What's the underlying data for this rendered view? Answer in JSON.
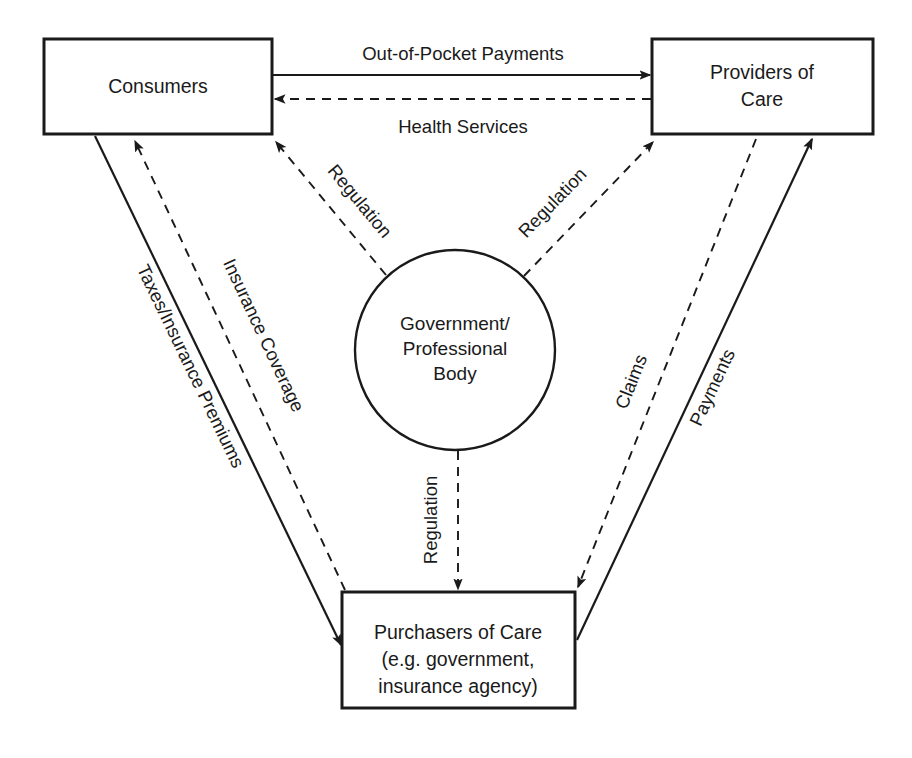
{
  "diagram": {
    "background_color": "#ffffff",
    "line_color": "#1a1a1a",
    "nodes": [
      {
        "id": "consumers",
        "shape": "rectangle",
        "label_line1": "Consumers",
        "label_line2": "",
        "label_line3": "",
        "x": 44,
        "y": 39,
        "width": 228,
        "height": 95
      },
      {
        "id": "providers",
        "shape": "rectangle",
        "label_line1": "Providers of",
        "label_line2": "Care",
        "label_line3": "",
        "x": 652,
        "y": 39,
        "width": 221,
        "height": 95
      },
      {
        "id": "purchasers",
        "shape": "rectangle",
        "label_line1": "Purchasers of Care",
        "label_line2": "(e.g. government,",
        "label_line3": "insurance agency)",
        "x": 342,
        "y": 592,
        "width": 233,
        "height": 116
      },
      {
        "id": "government",
        "shape": "circle",
        "label_line1": "Government/",
        "label_line2": "Professional",
        "label_line3": "Body",
        "cx": 455,
        "cy": 350,
        "r": 100
      }
    ],
    "edges": [
      {
        "id": "out-of-pocket-payments",
        "label": "Out-of-Pocket Payments",
        "style": "solid",
        "from": "consumers",
        "to": "providers",
        "direction": "right"
      },
      {
        "id": "health-services",
        "label": "Health Services",
        "style": "dashed",
        "from": "providers",
        "to": "consumers",
        "direction": "left"
      },
      {
        "id": "regulation-to-consumers",
        "label": "Regulation",
        "style": "dashed",
        "from": "government",
        "to": "consumers",
        "direction": "up-left"
      },
      {
        "id": "regulation-to-providers",
        "label": "Regulation",
        "style": "dashed",
        "from": "government",
        "to": "providers",
        "direction": "up-right"
      },
      {
        "id": "regulation-to-purchasers",
        "label": "Regulation",
        "style": "dashed",
        "from": "government",
        "to": "purchasers",
        "direction": "down"
      },
      {
        "id": "taxes-insurance-premiums",
        "label": "Taxes/Insurance  Premiums",
        "style": "solid",
        "from": "consumers",
        "to": "purchasers",
        "direction": "down-right"
      },
      {
        "id": "insurance-coverage",
        "label": "Insurance Coverage",
        "style": "dashed",
        "from": "purchasers",
        "to": "consumers",
        "direction": "up-left"
      },
      {
        "id": "claims",
        "label": "Claims",
        "style": "dashed",
        "from": "providers",
        "to": "purchasers",
        "direction": "down-left"
      },
      {
        "id": "payments",
        "label": "Payments",
        "style": "solid",
        "from": "purchasers",
        "to": "providers",
        "direction": "up-right"
      }
    ]
  }
}
